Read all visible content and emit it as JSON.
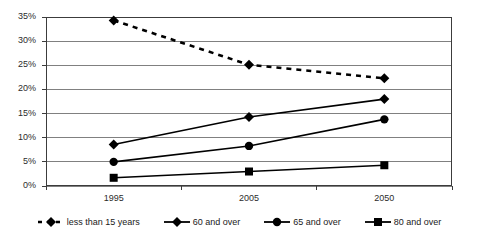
{
  "chart_data": {
    "type": "line",
    "title": "",
    "subtitle": "",
    "xlabel": "",
    "ylabel": "",
    "categories": [
      "1995",
      "2005",
      "2050"
    ],
    "x_tick_labels": [
      "1995",
      "2005",
      "2050"
    ],
    "y_tick_labels": [
      "0%",
      "5%",
      "10%",
      "15%",
      "20%",
      "25%",
      "30%",
      "35%"
    ],
    "y_tick_values": [
      0,
      5,
      10,
      15,
      20,
      25,
      30,
      35
    ],
    "ylim": [
      0,
      35
    ],
    "y_unit": "%",
    "grid": "horizontal",
    "legend_position": "bottom",
    "series": [
      {
        "name": "less than 15 years",
        "values": [
          34.3,
          25.1,
          22.3
        ],
        "line_style": "dashed",
        "marker": "diamond",
        "color": "#000000"
      },
      {
        "name": "60 and over",
        "values": [
          8.6,
          14.3,
          18.0
        ],
        "line_style": "solid",
        "marker": "diamond",
        "color": "#000000"
      },
      {
        "name": "65 and over",
        "values": [
          5.0,
          8.3,
          13.8
        ],
        "line_style": "solid",
        "marker": "circle",
        "color": "#000000"
      },
      {
        "name": "80 and over",
        "values": [
          1.7,
          3.0,
          4.3
        ],
        "line_style": "solid",
        "marker": "square",
        "color": "#000000"
      }
    ]
  },
  "legend": {
    "items": [
      {
        "label": "less than 15 years"
      },
      {
        "label": "60 and over"
      },
      {
        "label": "65 and over"
      },
      {
        "label": "80 and over"
      }
    ]
  },
  "colors": {
    "plot_border": "#3c3c3c",
    "gridline": "#808080",
    "series": "#000000",
    "text": "#2b2b2b",
    "background": "#ffffff"
  }
}
